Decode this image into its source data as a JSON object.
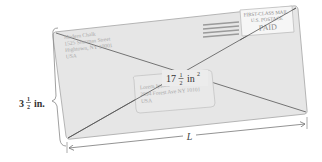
{
  "figure": {
    "return_address": {
      "lines": [
        "Modern Chalk",
        "1525 Sherman Street",
        "Hightown, NY 10001",
        "USA"
      ]
    },
    "postage_indicia": {
      "line1": "FIRST-CLASS MAIL",
      "line2": "U.S. POSTAGE",
      "line3": "PAID"
    },
    "recipient_address": {
      "lines": [
        "Lorem Ipsum",
        "2894 Forest Ave NY 10101",
        "USA"
      ]
    },
    "area_label": {
      "whole": "17",
      "numerator": "1",
      "denominator": "2",
      "unit": "in",
      "exponent": "2"
    },
    "height_label": {
      "whole": "3",
      "numerator": "1",
      "denominator": "2",
      "unit": "in."
    },
    "length_label": "L",
    "colors": {
      "envelope_fill": "#e6e6e6",
      "envelope_stroke": "#b0b0b0",
      "diagonal": "#555555",
      "cancel_bars": "#9a9a9a",
      "dimension_lines": "#777777",
      "text": "#333333"
    }
  }
}
